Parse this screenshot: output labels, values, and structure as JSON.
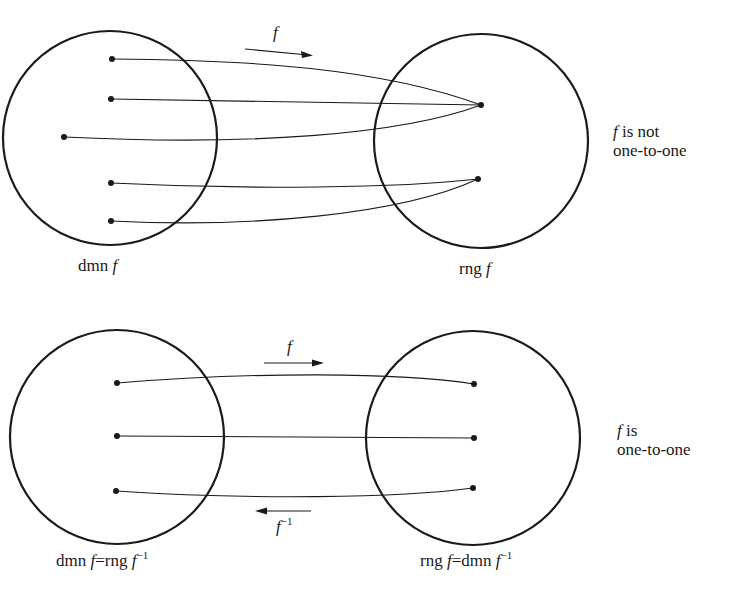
{
  "diagrams": [
    {
      "id": "not-one-to-one",
      "domain_label": {
        "prefix": "dmn",
        "fn": "f"
      },
      "range_label": {
        "prefix": "rng",
        "fn": "f"
      },
      "arrow_label": "f",
      "caption": {
        "fn": "f",
        "line1": "is not",
        "line2": "one-to-one"
      },
      "domain_points": 5,
      "range_points": 2,
      "mapping": [
        [
          0,
          0
        ],
        [
          1,
          0
        ],
        [
          2,
          0
        ],
        [
          3,
          1
        ],
        [
          4,
          1
        ]
      ]
    },
    {
      "id": "one-to-one",
      "domain_label": {
        "prefix": "dmn",
        "fn": "f",
        "eq": "=rng",
        "inv_fn": "f",
        "sup": "−1"
      },
      "range_label": {
        "prefix": "rng",
        "fn": "f",
        "eq": "=dmn",
        "inv_fn": "f",
        "sup": "−1"
      },
      "arrow_label": "f",
      "inverse_arrow_label": {
        "fn": "f",
        "sup": "−1"
      },
      "caption": {
        "fn": "f",
        "line1": "is",
        "line2": "one-to-one"
      },
      "domain_points": 3,
      "range_points": 3,
      "mapping": [
        [
          0,
          0
        ],
        [
          1,
          1
        ],
        [
          2,
          2
        ]
      ]
    }
  ]
}
